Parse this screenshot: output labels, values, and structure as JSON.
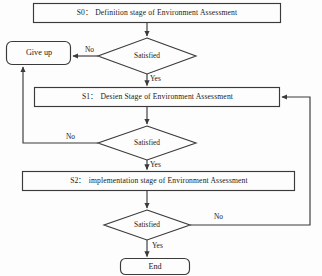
{
  "diagram": {
    "type": "flowchart",
    "background_color": "#fdfdfd",
    "line_color": "#3a3a3a",
    "text_color": "#1a1a1a",
    "nodes": [
      {
        "id": "s0",
        "shape": "rectangle",
        "label": "S0：  Definition stage of Environment Assessment"
      },
      {
        "id": "d1",
        "shape": "diamond",
        "label": "Satisfied"
      },
      {
        "id": "giveup",
        "shape": "rounded-rectangle",
        "label": "Give up"
      },
      {
        "id": "s1",
        "shape": "rectangle",
        "label": "S1：  Desien Stage of Environment Assessment"
      },
      {
        "id": "d2",
        "shape": "diamond",
        "label": "Satisfied"
      },
      {
        "id": "s2",
        "shape": "rectangle",
        "label": "S2：  implementation stage of Environment Assessment"
      },
      {
        "id": "d3",
        "shape": "diamond",
        "label": "Satisfied"
      },
      {
        "id": "end",
        "shape": "rounded-rectangle",
        "label": "End"
      }
    ],
    "edges": [
      {
        "id": "e-s0-d1",
        "from": "s0",
        "to": "d1",
        "label": ""
      },
      {
        "id": "e-d1-giveup",
        "from": "d1",
        "to": "giveup",
        "label": "No"
      },
      {
        "id": "e-d1-s1",
        "from": "d1",
        "to": "s1",
        "label": "Yes"
      },
      {
        "id": "e-s1-d2",
        "from": "s1",
        "to": "d2",
        "label": ""
      },
      {
        "id": "e-d2-giveup",
        "from": "d2",
        "to": "giveup",
        "label": "No"
      },
      {
        "id": "e-d2-s2",
        "from": "d2",
        "to": "s2",
        "label": "Yes"
      },
      {
        "id": "e-s2-d3",
        "from": "s2",
        "to": "d3",
        "label": ""
      },
      {
        "id": "e-d3-s1",
        "from": "d3",
        "to": "s1",
        "label": "No"
      },
      {
        "id": "e-d3-end",
        "from": "d3",
        "to": "end",
        "label": "Yes"
      }
    ]
  }
}
